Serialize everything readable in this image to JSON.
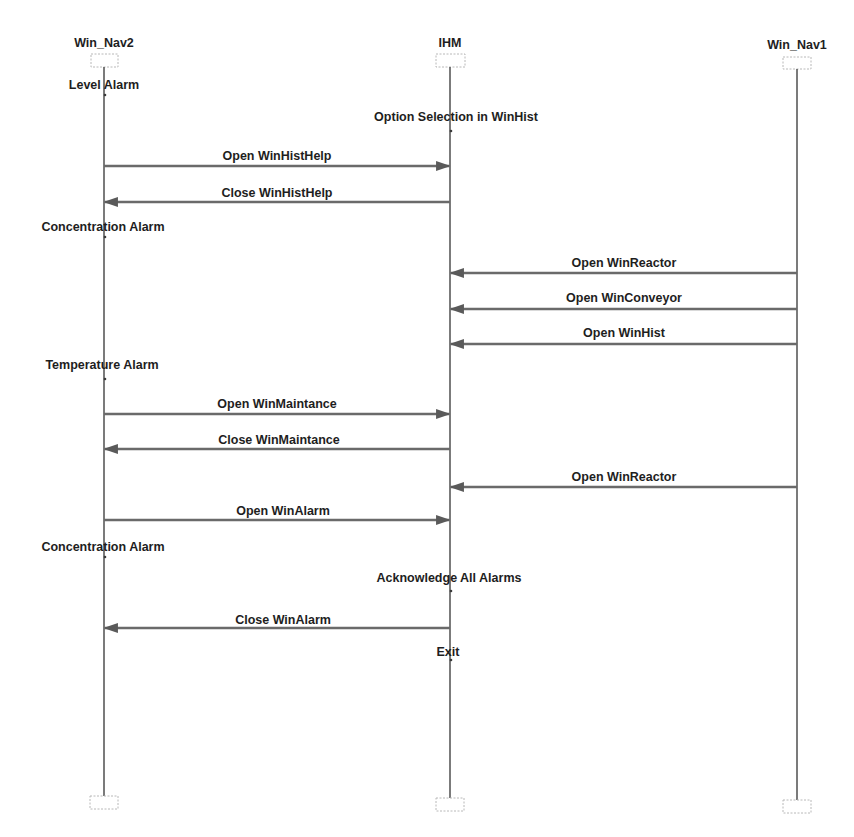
{
  "diagram": {
    "type": "sequence-diagram",
    "lifelines": [
      {
        "id": "nav2",
        "label": "Win_Nav2",
        "x": 104
      },
      {
        "id": "ihm",
        "label": "IHM",
        "x": 450
      },
      {
        "id": "nav1",
        "label": "Win_Nav1",
        "x": 797
      }
    ],
    "events": [
      {
        "kind": "state",
        "lifeline": "nav2",
        "label": "Level Alarm",
        "y": 89
      },
      {
        "kind": "state",
        "lifeline": "ihm",
        "label": "Option Selection in WinHist",
        "y": 121
      },
      {
        "kind": "message",
        "from": "nav2",
        "to": "ihm",
        "label": "Open WinHistHelp",
        "y": 166
      },
      {
        "kind": "message",
        "from": "ihm",
        "to": "nav2",
        "label": "Close WinHistHelp",
        "y": 202
      },
      {
        "kind": "state",
        "lifeline": "nav2",
        "label": "Concentration Alarm",
        "y": 231
      },
      {
        "kind": "message",
        "from": "nav1",
        "to": "ihm",
        "label": "Open WinReactor",
        "y": 273
      },
      {
        "kind": "message",
        "from": "nav1",
        "to": "ihm",
        "label": "Open WinConveyor",
        "y": 309
      },
      {
        "kind": "message",
        "from": "nav1",
        "to": "ihm",
        "label": "Open WinHist",
        "y": 344
      },
      {
        "kind": "state",
        "lifeline": "nav2",
        "label": "Temperature Alarm",
        "y": 369
      },
      {
        "kind": "message",
        "from": "nav2",
        "to": "ihm",
        "label": "Open WinMaintance",
        "y": 414
      },
      {
        "kind": "message",
        "from": "ihm",
        "to": "nav2",
        "label": "Close WinMaintance",
        "y": 449
      },
      {
        "kind": "message",
        "from": "nav1",
        "to": "ihm",
        "label": "Open WinReactor",
        "y": 487
      },
      {
        "kind": "message",
        "from": "nav2",
        "to": "ihm",
        "label": "Open WinAlarm",
        "y": 520
      },
      {
        "kind": "state",
        "lifeline": "nav2",
        "label": "Concentration Alarm",
        "y": 551
      },
      {
        "kind": "state",
        "lifeline": "ihm",
        "label": "Acknowledge All Alarms",
        "y": 582
      },
      {
        "kind": "message",
        "from": "ihm",
        "to": "nav2",
        "label": "Close WinAlarm",
        "y": 628
      },
      {
        "kind": "state",
        "lifeline": "ihm",
        "label": "Exit",
        "y": 656
      }
    ]
  },
  "colors": {
    "background": "#ffffff",
    "lifeline": "#5a5a5a",
    "message": "#6a6a6a",
    "text": "#1e1e1e",
    "box_border": "#b8b8b8"
  }
}
